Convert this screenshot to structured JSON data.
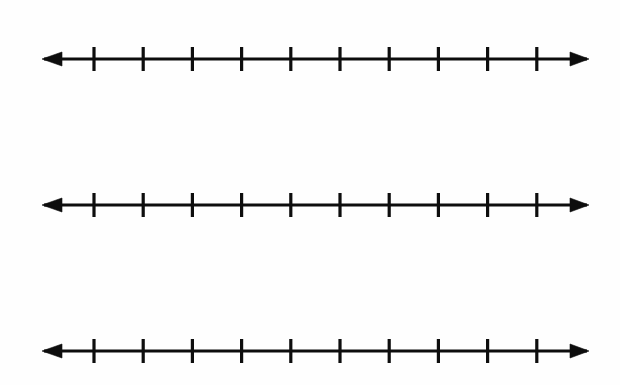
{
  "page": {
    "width": 620,
    "height": 385,
    "background_color": "#fefefe",
    "ink_color": "#0d0d0d"
  },
  "chart_data": {
    "type": "line",
    "title": "",
    "subtitle": "",
    "xlabel": "",
    "ylabel": "",
    "grid": false,
    "legend": null,
    "series": [],
    "annotations": [],
    "number_lines": [
      {
        "name": "number-line-1",
        "index": 1,
        "axis_y": 59,
        "axis_x_start": 44,
        "axis_x_end": 587,
        "arrow_left": true,
        "arrow_right": true,
        "arrow_tip_left_x": 42,
        "arrow_tip_right_x": 589,
        "arrow_base_left_x": 62,
        "arrow_base_right_x": 570,
        "arrow_half_height": 7,
        "tick_count": 10,
        "tick_first_x": 94,
        "tick_spacing": 49.2,
        "tick_half_height": 12,
        "tick_labels": [],
        "plotted_points": []
      },
      {
        "name": "number-line-2",
        "index": 2,
        "axis_y": 205,
        "axis_x_start": 44,
        "axis_x_end": 587,
        "arrow_left": true,
        "arrow_right": true,
        "arrow_tip_left_x": 42,
        "arrow_tip_right_x": 589,
        "arrow_base_left_x": 62,
        "arrow_base_right_x": 570,
        "arrow_half_height": 7,
        "tick_count": 10,
        "tick_first_x": 94,
        "tick_spacing": 49.2,
        "tick_half_height": 12,
        "tick_labels": [],
        "plotted_points": []
      },
      {
        "name": "number-line-3",
        "index": 3,
        "axis_y": 351,
        "axis_x_start": 44,
        "axis_x_end": 587,
        "arrow_left": true,
        "arrow_right": true,
        "arrow_tip_left_x": 42,
        "arrow_tip_right_x": 589,
        "arrow_base_left_x": 62,
        "arrow_base_right_x": 570,
        "arrow_half_height": 7,
        "tick_count": 10,
        "tick_first_x": 94,
        "tick_spacing": 49.2,
        "tick_half_height": 12,
        "tick_labels": [],
        "plotted_points": []
      }
    ]
  }
}
